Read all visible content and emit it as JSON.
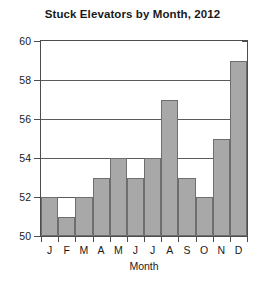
{
  "chart_data": {
    "type": "bar",
    "title": "Stuck Elevators by Month, 2012",
    "xlabel": "Month",
    "ylabel": "",
    "categories": [
      "J",
      "F",
      "M",
      "A",
      "M",
      "J",
      "J",
      "A",
      "S",
      "O",
      "N",
      "D"
    ],
    "values": [
      52,
      51,
      52,
      53,
      54,
      53,
      54,
      57,
      53,
      52,
      55,
      59
    ],
    "ylim": [
      50,
      60
    ],
    "yticks": [
      50,
      52,
      54,
      56,
      58,
      60
    ],
    "ytick_labels": [
      "50",
      "52",
      "54",
      "56",
      "58",
      "60"
    ],
    "grid": true,
    "grid_axis": "y",
    "legend": false,
    "legend_position": "none",
    "series": [
      {
        "name": "Stuck Elevators",
        "values": [
          52,
          51,
          52,
          53,
          54,
          53,
          54,
          57,
          53,
          52,
          55,
          59
        ]
      }
    ],
    "colors": {
      "bar_fill": "#a8a8a8",
      "bar_border": "#6e6e6e",
      "axis": "#4d4d4d",
      "grid": "#5a5a5a",
      "text": "#1a1a1a",
      "background": "#ffffff"
    }
  }
}
